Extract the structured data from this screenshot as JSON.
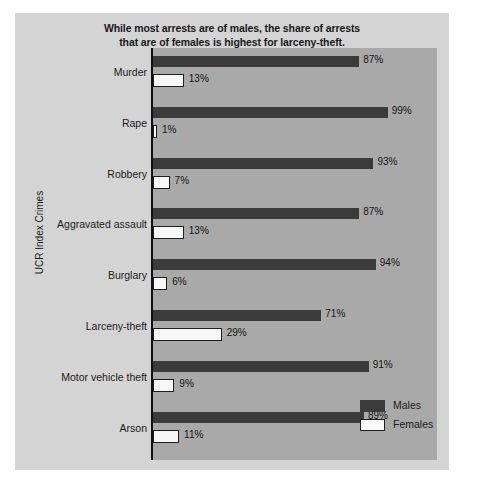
{
  "chart_data": {
    "type": "bar",
    "orientation": "horizontal",
    "title": "While most arrests are of males, the share of arrests that are of females is highest for larceny-theft.",
    "title_lines": [
      "While most arrests are of males, the share of arrests",
      "that are of females is highest for larceny-theft."
    ],
    "xlabel": "",
    "ylabel": "UCR Index Crimes",
    "xlim": [
      0,
      120
    ],
    "grid": false,
    "legend_position": "bottom-right",
    "categories": [
      "Murder",
      "Rape",
      "Robbery",
      "Aggravated assault",
      "Burglary",
      "Larceny-theft",
      "Motor vehicle theft",
      "Arson"
    ],
    "series": [
      {
        "name": "Males",
        "color": "#3b3b3b",
        "values": [
          87,
          99,
          93,
          87,
          94,
          71,
          91,
          89
        ],
        "labels": [
          "87%",
          "99%",
          "93%",
          "87%",
          "94%",
          "71%",
          "91%",
          "89%"
        ]
      },
      {
        "name": "Females",
        "color": "#f7f7f7",
        "values": [
          13,
          1,
          7,
          13,
          6,
          29,
          9,
          11
        ],
        "labels": [
          "13%",
          "1%",
          "7%",
          "13%",
          "6%",
          "29%",
          "9%",
          "11%"
        ]
      }
    ],
    "colors": {
      "figure_background": "#d4d4d4",
      "plot_background": "#a9a9a9",
      "males_bar": "#3b3b3b",
      "females_bar": "#f7f7f7",
      "axis": "#111111",
      "text": "#1a1a1a"
    }
  },
  "legend": {
    "items": [
      {
        "label": "Males"
      },
      {
        "label": "Females"
      }
    ]
  }
}
